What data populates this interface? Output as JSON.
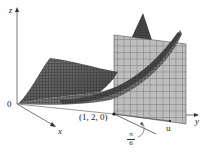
{
  "figure": {
    "axes": {
      "z_label": "z",
      "x_label": "x",
      "y_label": "y",
      "origin_label": "0"
    },
    "point_label": "(1, 2, 0)",
    "angle_label": {
      "numerator": "π",
      "denominator": "6"
    },
    "vector_label": "u",
    "colors": {
      "surface_dark": "#3a3a3a",
      "surface_mid": "#6e6e6e",
      "plane_fill": "#b8b8b8",
      "grid_line": "#4a4a4a",
      "axis": "#444444"
    }
  }
}
